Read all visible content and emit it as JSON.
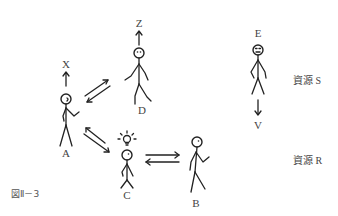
{
  "figure": {
    "caption": "図Ⅱ－3",
    "persons": [
      {
        "id": "A",
        "label": "A",
        "goal_label": "X",
        "goal_direction": "up"
      },
      {
        "id": "B",
        "label": "B"
      },
      {
        "id": "C",
        "label": "C",
        "has_lightbulb": true
      },
      {
        "id": "D",
        "label": "D",
        "goal_label": "Z",
        "goal_direction": "up"
      },
      {
        "id": "E",
        "label": "E",
        "goal_label": "V",
        "goal_direction": "down"
      }
    ],
    "exchanges": [
      {
        "between": [
          "A",
          "D"
        ],
        "type": "bidirectional"
      },
      {
        "between": [
          "A",
          "C"
        ],
        "type": "bidirectional"
      },
      {
        "between": [
          "C",
          "B"
        ],
        "type": "bidirectional"
      }
    ],
    "resources": [
      {
        "label": "資源 S"
      },
      {
        "label": "資源 R"
      }
    ]
  }
}
